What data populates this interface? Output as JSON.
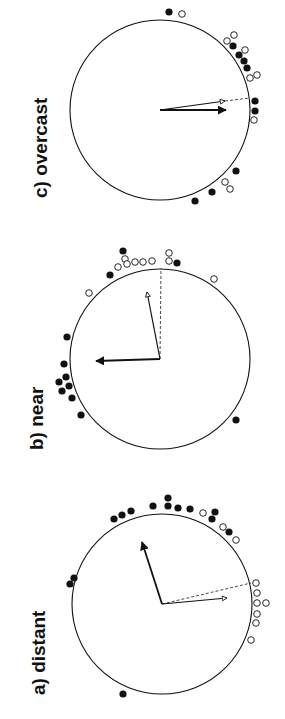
{
  "chart_data": [
    {
      "type": "circular-scatter",
      "panel": "c",
      "title": "c) overcast",
      "center": [
        160,
        110
      ],
      "radius": 90,
      "label_pos": [
        30,
        198
      ],
      "mean_vectors": [
        {
          "name": "open-mean",
          "style": "open-arrow",
          "from": [
            160,
            110
          ],
          "to": [
            225,
            101
          ]
        },
        {
          "name": "filled-mean",
          "style": "filled-arrow",
          "from": [
            160,
            110
          ],
          "to": [
            226,
            110
          ]
        }
      ],
      "reference_line": {
        "from": [
          225,
          101
        ],
        "to": [
          250,
          98
        ]
      },
      "filled_points": [
        [
          169,
          12
        ],
        [
          233,
          46
        ],
        [
          239,
          55
        ],
        [
          244,
          61
        ],
        [
          247,
          68
        ],
        [
          255,
          101
        ],
        [
          255,
          111
        ],
        [
          236,
          171
        ],
        [
          212,
          192
        ],
        [
          195,
          201
        ]
      ],
      "open_points": [
        [
          182,
          14
        ],
        [
          234,
          35
        ],
        [
          227,
          41
        ],
        [
          245,
          50
        ],
        [
          250,
          78
        ],
        [
          257,
          75
        ],
        [
          254,
          120
        ],
        [
          225,
          182
        ],
        [
          230,
          189
        ]
      ]
    },
    {
      "type": "circular-scatter",
      "panel": "b",
      "title": "b) near",
      "center": [
        160,
        359
      ],
      "radius": 90,
      "label_pos": [
        26,
        450
      ],
      "mean_vectors": [
        {
          "name": "open-mean",
          "style": "open-arrow",
          "from": [
            160,
            359
          ],
          "to": [
            147,
            292
          ]
        },
        {
          "name": "filled-mean",
          "style": "filled-arrow",
          "from": [
            160,
            359
          ],
          "to": [
            96,
            361
          ]
        }
      ],
      "reference_line": {
        "from": [
          160,
          359
        ],
        "to": [
          161,
          268
        ]
      },
      "filled_points": [
        [
          123,
          251
        ],
        [
          110,
          275
        ],
        [
          177,
          263
        ],
        [
          67,
          337
        ],
        [
          64,
          364
        ],
        [
          66,
          377
        ],
        [
          59,
          382
        ],
        [
          69,
          386
        ],
        [
          62,
          391
        ],
        [
          72,
          398
        ],
        [
          81,
          415
        ],
        [
          236,
          420
        ]
      ],
      "open_points": [
        [
          125,
          259
        ],
        [
          118,
          267
        ],
        [
          127,
          264
        ],
        [
          135,
          262
        ],
        [
          143,
          262
        ],
        [
          152,
          261
        ],
        [
          169,
          253
        ],
        [
          169,
          261
        ],
        [
          214,
          279
        ],
        [
          89,
          293
        ]
      ]
    },
    {
      "type": "circular-scatter",
      "panel": "a",
      "title": "a) distant",
      "center": [
        162,
        604
      ],
      "radius": 90,
      "label_pos": [
        28,
        695
      ],
      "mean_vectors": [
        {
          "name": "filled-mean",
          "style": "filled-arrow",
          "from": [
            162,
            604
          ],
          "to": [
            142,
            542
          ]
        },
        {
          "name": "open-mean",
          "style": "open-arrow",
          "from": [
            162,
            604
          ],
          "to": [
            227,
            598
          ]
        }
      ],
      "reference_line": {
        "from": [
          162,
          604
        ],
        "to": [
          251,
          583
        ]
      },
      "filled_points": [
        [
          114,
          519
        ],
        [
          122,
          515
        ],
        [
          131,
          511
        ],
        [
          153,
          506
        ],
        [
          168,
          498
        ],
        [
          168,
          506
        ],
        [
          178,
          508
        ],
        [
          190,
          509
        ],
        [
          215,
          512
        ],
        [
          212,
          519
        ],
        [
          229,
          532
        ],
        [
          74,
          578
        ],
        [
          70,
          584
        ],
        [
          123,
          694
        ]
      ],
      "open_points": [
        [
          203,
          513
        ],
        [
          223,
          527
        ],
        [
          236,
          540
        ],
        [
          256,
          583
        ],
        [
          257,
          593
        ],
        [
          257,
          603
        ],
        [
          266,
          603
        ],
        [
          257,
          614
        ],
        [
          256,
          623
        ],
        [
          251,
          640
        ]
      ]
    }
  ]
}
